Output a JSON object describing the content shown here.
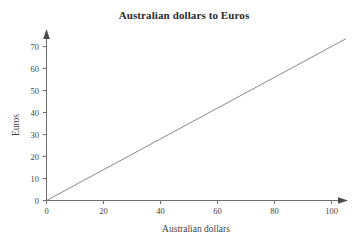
{
  "chart_data": {
    "type": "line",
    "title": "Australian dollars to Euros",
    "xlabel": "Australian dollars",
    "ylabel": "Euros",
    "xlim": [
      0,
      105
    ],
    "ylim": [
      0,
      75
    ],
    "grid": false,
    "legend": "none",
    "x_ticks": [
      "0",
      "20",
      "40",
      "60",
      "80",
      "100"
    ],
    "x_tick_values": [
      0,
      20,
      40,
      60,
      80,
      100
    ],
    "y_ticks": [
      "0",
      "10",
      "20",
      "30",
      "40",
      "50",
      "60",
      "70"
    ],
    "y_tick_values": [
      0,
      10,
      20,
      30,
      40,
      50,
      60,
      70
    ],
    "series": [
      {
        "name": "Australian dollars to Euros",
        "color": "#7a7a7a",
        "x": [
          0,
          105
        ],
        "values": [
          0,
          73.5
        ],
        "slope": 0.7,
        "points": [
          {
            "x": 0,
            "y": 0
          },
          {
            "x": 20,
            "y": 14
          },
          {
            "x": 40,
            "y": 28
          },
          {
            "x": 60,
            "y": 42
          },
          {
            "x": 80,
            "y": 56
          },
          {
            "x": 100,
            "y": 70
          },
          {
            "x": 105,
            "y": 73.5
          }
        ]
      }
    ],
    "colors": {
      "background": "#ffffff",
      "axis": "#6e6e6e",
      "line": "#7a7a7a",
      "text": "#3f3f3f",
      "title": "#2b2b2b"
    }
  }
}
